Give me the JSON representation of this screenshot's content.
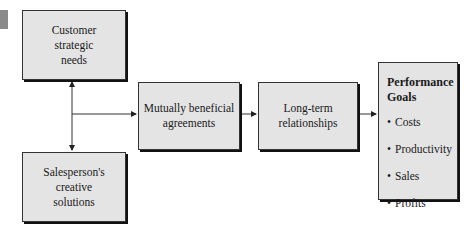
{
  "diagram": {
    "nodes": {
      "customer": {
        "lines": [
          "Customer",
          "strategic",
          "needs"
        ]
      },
      "salesperson": {
        "lines": [
          "Salesperson's",
          "creative",
          "solutions"
        ]
      },
      "mutual": {
        "lines": [
          "Mutually beneficial",
          "agreements"
        ]
      },
      "longterm": {
        "lines": [
          "Long-term",
          "relationships"
        ]
      },
      "performance": {
        "title_lines": [
          "Performance",
          "Goals"
        ],
        "items": [
          "Costs",
          "Productivity",
          "Sales",
          "Profits"
        ]
      }
    },
    "edges": [
      {
        "from": "junction",
        "to": "customer"
      },
      {
        "from": "junction",
        "to": "salesperson"
      },
      {
        "from": "junction",
        "to": "mutual"
      },
      {
        "from": "mutual",
        "to": "longterm"
      },
      {
        "from": "longterm",
        "to": "performance"
      }
    ],
    "colors": {
      "box_fill": "#e4e4e4",
      "border": "#333333",
      "corner_mark": "#8a8a8a"
    }
  }
}
